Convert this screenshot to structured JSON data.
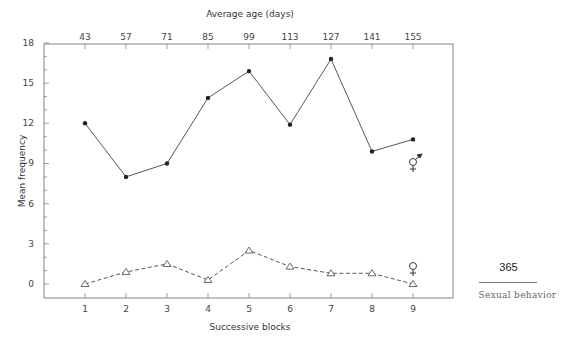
{
  "chart_data": {
    "type": "line",
    "title": "",
    "top_axis_title": "Average age (days)",
    "top_axis_ticks": [
      "43",
      "57",
      "71",
      "85",
      "99",
      "113",
      "127",
      "141",
      "155"
    ],
    "xlabel": "Successive blocks",
    "ylabel": "Mean frequency",
    "categories": [
      "1",
      "2",
      "3",
      "4",
      "5",
      "6",
      "7",
      "8",
      "9"
    ],
    "y_ticks": [
      "0",
      "3",
      "6",
      "9",
      "12",
      "15",
      "18"
    ],
    "ylim": [
      -1,
      18
    ],
    "grid": false,
    "series": [
      {
        "name": "male (♂ paired with ♀)",
        "marker": "filled-circle",
        "line": "solid",
        "label_symbol": "⚥",
        "values": [
          12.0,
          8.0,
          9.0,
          13.9,
          15.9,
          11.9,
          16.8,
          9.9,
          10.8
        ]
      },
      {
        "name": "female (♀)",
        "marker": "open-triangle",
        "line": "dashed",
        "label_symbol": "♀",
        "values": [
          0.0,
          0.9,
          1.5,
          0.3,
          2.5,
          1.3,
          0.8,
          0.8,
          0.0
        ]
      }
    ]
  },
  "page": {
    "number": "365",
    "section": "Sexual behavior"
  }
}
